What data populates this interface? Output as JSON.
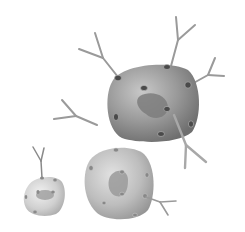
{
  "figure": {
    "background": "#ffffff",
    "colors": {
      "large_cell": "#8a8a8a",
      "medium_cell": "#b4b4b4",
      "small_cell": "#cfcfcf",
      "nucleus": "#7a7a7a",
      "receptor": "#4a4a4a",
      "antibody": "#9a9a9a"
    },
    "cells": [
      {
        "name": "large-cell",
        "receptors": 9,
        "bound_antibodies": 4
      },
      {
        "name": "medium-cell",
        "receptors": 8,
        "bound_antibodies": 1
      },
      {
        "name": "small-cell",
        "receptors": 6,
        "bound_antibodies": 1
      }
    ],
    "free_antibodies": 1
  }
}
